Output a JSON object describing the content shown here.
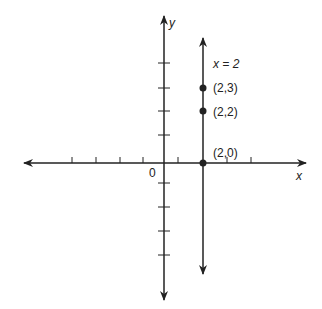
{
  "diagram": {
    "x_axis_label": "x",
    "y_axis_label": "y",
    "origin_label": "0",
    "line_label": "x = 2",
    "points": [
      {
        "label": "(2,3)",
        "x": 2,
        "y": 3
      },
      {
        "label": "(2,2)",
        "x": 2,
        "y": 2
      },
      {
        "label": "(2,0)",
        "x": 2,
        "y": 0
      }
    ],
    "colors": {
      "ink": "#222222",
      "background": "#ffffff"
    }
  }
}
